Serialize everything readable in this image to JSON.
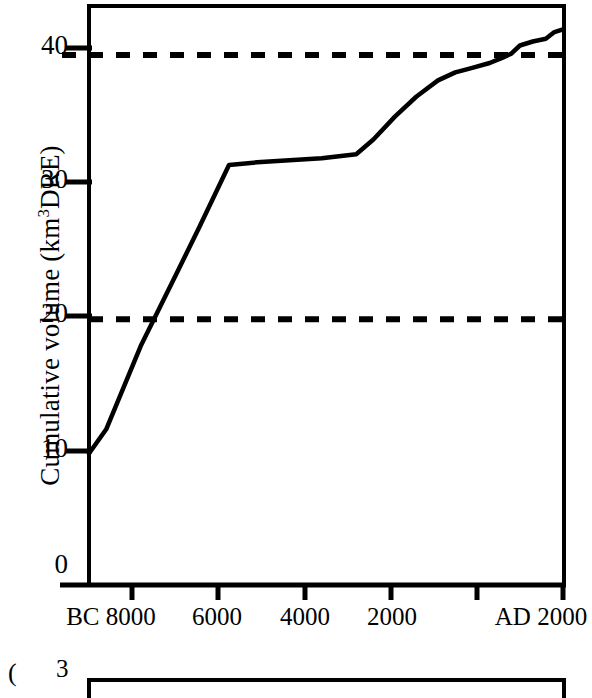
{
  "figure": {
    "panel_label_b": "(",
    "background": "#ffffff",
    "ink": "#000000"
  },
  "chart_data": {
    "type": "line",
    "title": "",
    "xlabel": "",
    "ylabel": "Cumulative volume (km3DRE)",
    "ylabel_parts": {
      "pre": "Cumulative volume (km",
      "sup": "3",
      "post": "DRE)"
    },
    "xlim": [
      -9000,
      2000
    ],
    "ylim": [
      0,
      43
    ],
    "grid": false,
    "legend": "none",
    "x_ticks": [
      {
        "value": -8000,
        "label": "BC 8000"
      },
      {
        "value": -6000,
        "label": "6000"
      },
      {
        "value": -4000,
        "label": "4000"
      },
      {
        "value": -2000,
        "label": "2000"
      },
      {
        "value": 0,
        "label": ""
      },
      {
        "value": 2000,
        "label": "AD 2000"
      }
    ],
    "y_ticks": [
      {
        "value": 0,
        "label": "0"
      },
      {
        "value": 10,
        "label": "10"
      },
      {
        "value": 20,
        "label": "20"
      },
      {
        "value": 30,
        "label": "30"
      },
      {
        "value": 40,
        "label": "40"
      }
    ],
    "reference_lines": [
      {
        "name": "upper-threshold",
        "y": 39.5,
        "style": "dashed"
      },
      {
        "name": "lower-threshold",
        "y": 19.8,
        "style": "dashed"
      }
    ],
    "series": [
      {
        "name": "cumulative-volume",
        "style": "solid",
        "points": [
          [
            -9000,
            9.8
          ],
          [
            -8600,
            11.6
          ],
          [
            -7800,
            17.8
          ],
          [
            -7000,
            23.0
          ],
          [
            -6450,
            26.6
          ],
          [
            -5750,
            31.3
          ],
          [
            -5100,
            31.5
          ],
          [
            -3600,
            31.8
          ],
          [
            -2800,
            32.1
          ],
          [
            -2400,
            33.2
          ],
          [
            -1900,
            34.9
          ],
          [
            -1400,
            36.4
          ],
          [
            -900,
            37.6
          ],
          [
            -500,
            38.2
          ],
          [
            -150,
            38.5
          ],
          [
            300,
            38.9
          ],
          [
            600,
            39.3
          ],
          [
            800,
            39.6
          ],
          [
            1000,
            40.2
          ],
          [
            1300,
            40.5
          ],
          [
            1600,
            40.7
          ],
          [
            1800,
            41.2
          ],
          [
            2000,
            41.4
          ]
        ]
      }
    ]
  },
  "panel_b": {
    "ytick_top": "3"
  }
}
